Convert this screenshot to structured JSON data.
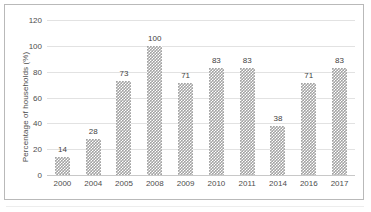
{
  "chart_data": {
    "type": "bar",
    "title": "",
    "subtitle": "",
    "xlabel": "",
    "ylabel": "Percentage of households (%)",
    "categories": [
      "2000",
      "2004",
      "2005",
      "2008",
      "2009",
      "2010",
      "2011",
      "2014",
      "2016",
      "2017"
    ],
    "values": [
      14,
      28,
      73,
      100,
      71,
      83,
      83,
      38,
      71,
      83
    ],
    "data_labels": [
      "14",
      "28",
      "73",
      "100",
      "71",
      "83",
      "83",
      "38",
      "71",
      "83"
    ],
    "ylim": [
      0,
      120
    ],
    "yticks": [
      0,
      20,
      40,
      60,
      80,
      100,
      120
    ],
    "ytick_labels": [
      "0",
      "20",
      "40",
      "60",
      "80",
      "100",
      "120"
    ],
    "grid": "horizontal",
    "legend": "none",
    "bar_fill": "#a3a3a3",
    "bar_pattern": "checkered-dots",
    "axis_text_color": "#4d4d4d",
    "gridline_color": "#e2e2e2",
    "frame_color": "#b9b9b9",
    "background": "#ffffff"
  }
}
